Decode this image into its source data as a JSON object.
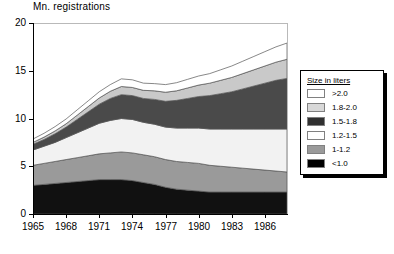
{
  "figure": {
    "background": "#ffffff",
    "width": 394,
    "height": 254
  },
  "chart_data": {
    "type": "area",
    "stacked": true,
    "title": "",
    "xlabel": "",
    "ylabel": "Mn. registrations",
    "ylim": [
      0,
      20
    ],
    "xlim": [
      1965,
      1988
    ],
    "grid": false,
    "legend_position": "right",
    "legend_title": "Size in liters",
    "ytick_labels": [
      "0",
      "5",
      "10",
      "15",
      "20"
    ],
    "ytick_values": [
      0,
      5,
      10,
      15,
      20
    ],
    "xtick_labels": [
      "1965",
      "1968",
      "1971",
      "1974",
      "1977",
      "1980",
      "1983",
      "1986"
    ],
    "xtick_values": [
      1965,
      1968,
      1971,
      1974,
      1977,
      1980,
      1983,
      1986
    ],
    "x": [
      1965,
      1966,
      1967,
      1968,
      1969,
      1970,
      1971,
      1972,
      1973,
      1974,
      1975,
      1976,
      1977,
      1978,
      1979,
      1980,
      1981,
      1982,
      1983,
      1984,
      1985,
      1986,
      1987,
      1988
    ],
    "series": [
      {
        "name": "<1.0",
        "color": "#111111",
        "values": [
          3.0,
          3.1,
          3.2,
          3.3,
          3.4,
          3.5,
          3.6,
          3.6,
          3.6,
          3.5,
          3.3,
          3.1,
          2.8,
          2.6,
          2.5,
          2.4,
          2.3,
          2.3,
          2.3,
          2.3,
          2.3,
          2.3,
          2.3,
          2.3
        ]
      },
      {
        "name": "1-1.2",
        "color": "#9a9a9a",
        "values": [
          2.1,
          2.2,
          2.3,
          2.4,
          2.5,
          2.6,
          2.7,
          2.8,
          2.9,
          2.9,
          2.9,
          2.9,
          2.9,
          2.9,
          2.9,
          2.9,
          2.8,
          2.7,
          2.6,
          2.5,
          2.4,
          2.3,
          2.2,
          2.1
        ]
      },
      {
        "name": "1.2-1.5",
        "color": "#f2f2f2",
        "values": [
          1.6,
          1.8,
          2.0,
          2.3,
          2.6,
          2.9,
          3.2,
          3.4,
          3.5,
          3.5,
          3.4,
          3.4,
          3.4,
          3.5,
          3.6,
          3.7,
          3.8,
          3.9,
          4.0,
          4.1,
          4.2,
          4.3,
          4.4,
          4.5
        ]
      },
      {
        "name": "1.5-1.8",
        "color": "#4a4a4a",
        "values": [
          0.6,
          0.7,
          0.9,
          1.1,
          1.4,
          1.7,
          2.0,
          2.3,
          2.5,
          2.5,
          2.5,
          2.6,
          2.7,
          2.9,
          3.1,
          3.3,
          3.5,
          3.7,
          3.9,
          4.2,
          4.5,
          4.8,
          5.1,
          5.3
        ]
      },
      {
        "name": "1.8-2.0",
        "color": "#c9c9c9",
        "values": [
          0.2,
          0.25,
          0.3,
          0.35,
          0.45,
          0.55,
          0.65,
          0.75,
          0.85,
          0.85,
          0.85,
          0.9,
          0.95,
          1.0,
          1.1,
          1.2,
          1.3,
          1.4,
          1.5,
          1.6,
          1.7,
          1.8,
          1.9,
          2.0
        ]
      },
      {
        "name": ">2.0",
        "color": "#ffffff",
        "values": [
          0.35,
          0.4,
          0.45,
          0.5,
          0.55,
          0.6,
          0.65,
          0.7,
          0.8,
          0.8,
          0.75,
          0.75,
          0.8,
          0.85,
          0.9,
          0.95,
          1.0,
          1.1,
          1.2,
          1.3,
          1.4,
          1.5,
          1.6,
          1.7
        ]
      }
    ],
    "legend_entries": [
      {
        "label": ">2.0",
        "color": "#ffffff"
      },
      {
        "label": "1.8-2.0",
        "color": "#d8d8d8"
      },
      {
        "label": "1.5-1.8",
        "color": "#303030"
      },
      {
        "label": "1.2-1.5",
        "color": "#ffffff"
      },
      {
        "label": "1-1.2",
        "color": "#9a9a9a"
      },
      {
        "label": "<1.0",
        "color": "#000000"
      }
    ]
  }
}
